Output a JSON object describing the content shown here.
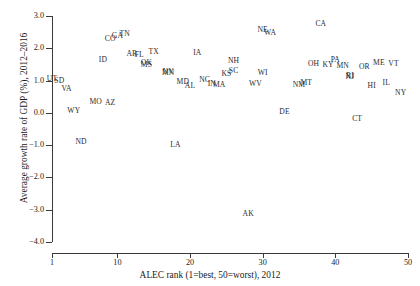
{
  "chart_data": {
    "type": "scatter",
    "title": "",
    "xlabel": "ALEC rank (1=best, 50=worst), 2012",
    "ylabel": "Average growth rate of GDP (%), 2012–2016",
    "xlim": [
      1,
      50
    ],
    "ylim": [
      -4.0,
      3.0
    ],
    "xticks": [
      1,
      10,
      20,
      30,
      40,
      50
    ],
    "xtick_labels": [
      "1",
      "10",
      "20",
      "30",
      "40",
      "50"
    ],
    "yticks": [
      -4.0,
      -3.0,
      -2.0,
      -1.0,
      0.0,
      1.0,
      2.0,
      3.0
    ],
    "ytick_labels": [
      "-4.0",
      "-3.0",
      "-2.0",
      "-1.0",
      "0.0",
      "1.0",
      "2.0",
      "3.0"
    ],
    "grid": false,
    "legend": null,
    "marker_style": "text-label",
    "point_color": "#2b2b2b",
    "points": [
      {
        "label": "UT",
        "x": 1,
        "y": 1.05
      },
      {
        "label": "SD",
        "x": 2,
        "y": 0.98
      },
      {
        "label": "VA",
        "x": 3,
        "y": 0.75
      },
      {
        "label": "WY",
        "x": 4,
        "y": 0.05
      },
      {
        "label": "ND",
        "x": 5,
        "y": -0.9
      },
      {
        "label": "MO",
        "x": 7,
        "y": 0.35
      },
      {
        "label": "ID",
        "x": 8,
        "y": 1.65
      },
      {
        "label": "AZ",
        "x": 9,
        "y": 0.3
      },
      {
        "label": "CO",
        "x": 9,
        "y": 2.28
      },
      {
        "label": "GA",
        "x": 10,
        "y": 2.38
      },
      {
        "label": "TN",
        "x": 11,
        "y": 2.45
      },
      {
        "label": "AR",
        "x": 12,
        "y": 1.82
      },
      {
        "label": "FL",
        "x": 13,
        "y": 1.8
      },
      {
        "label": "OK",
        "x": 14,
        "y": 1.55
      },
      {
        "label": "MS",
        "x": 14,
        "y": 1.48
      },
      {
        "label": "TX",
        "x": 15,
        "y": 1.9
      },
      {
        "label": "MN",
        "x": 17,
        "y": 1.25
      },
      {
        "label": "NV",
        "x": 17,
        "y": 1.28
      },
      {
        "label": "MD",
        "x": 19,
        "y": 0.95
      },
      {
        "label": "AL",
        "x": 20,
        "y": 0.82
      },
      {
        "label": "IA",
        "x": 21,
        "y": 1.85
      },
      {
        "label": "NC",
        "x": 22,
        "y": 1.02
      },
      {
        "label": "IN",
        "x": 23,
        "y": 0.88
      },
      {
        "label": "MA",
        "x": 24,
        "y": 0.85
      },
      {
        "label": "KS",
        "x": 25,
        "y": 1.2
      },
      {
        "label": "SC",
        "x": 26,
        "y": 1.3
      },
      {
        "label": "NH",
        "x": 26,
        "y": 1.62
      },
      {
        "label": "AK",
        "x": 28,
        "y": -3.12
      },
      {
        "label": "WV",
        "x": 29,
        "y": 0.88
      },
      {
        "label": "NE",
        "x": 30,
        "y": 2.58
      },
      {
        "label": "WI",
        "x": 30,
        "y": 1.25
      },
      {
        "label": "WA",
        "x": 31,
        "y": 2.48
      },
      {
        "label": "DE",
        "x": 33,
        "y": 0.02
      },
      {
        "label": "NM",
        "x": 35,
        "y": 0.85
      },
      {
        "label": "MT",
        "x": 36,
        "y": 0.92
      },
      {
        "label": "OH",
        "x": 37,
        "y": 1.5
      },
      {
        "label": "CA",
        "x": 38,
        "y": 2.75
      },
      {
        "label": "KY",
        "x": 39,
        "y": 1.48
      },
      {
        "label": "PA",
        "x": 40,
        "y": 1.65
      },
      {
        "label": "MN",
        "x": 41,
        "y": 1.45
      },
      {
        "label": "NJ",
        "x": 42,
        "y": 1.12
      },
      {
        "label": "RI",
        "x": 42,
        "y": 1.15
      },
      {
        "label": "CT",
        "x": 43,
        "y": -0.18
      },
      {
        "label": "OR",
        "x": 44,
        "y": 1.42
      },
      {
        "label": "HI",
        "x": 45,
        "y": 0.82
      },
      {
        "label": "ME",
        "x": 46,
        "y": 1.55
      },
      {
        "label": "IL",
        "x": 47,
        "y": 0.92
      },
      {
        "label": "VT",
        "x": 48,
        "y": 1.52
      },
      {
        "label": "NY",
        "x": 49,
        "y": 0.62
      },
      {
        "label": "LA",
        "x": 18,
        "y": -0.98
      }
    ]
  }
}
